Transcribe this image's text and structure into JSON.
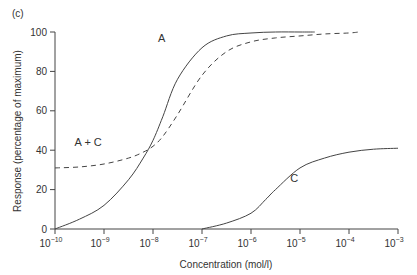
{
  "panel_label": "(c)",
  "chart_data": {
    "type": "line",
    "title": "",
    "xlabel": "Concentration (mol/l)",
    "ylabel": "Response (percentage of maximum)",
    "xscale": "log",
    "xlim": [
      1e-10,
      0.001
    ],
    "ylim": [
      0,
      100
    ],
    "grid": false,
    "legend": "inline curve labels",
    "x_ticks": [
      "10-10",
      "10-9",
      "10-8",
      "10-7",
      "10-6",
      "10-5",
      "10-4",
      "10-3"
    ],
    "y_ticks": [
      "0",
      "20",
      "40",
      "60",
      "80",
      "100"
    ],
    "series": [
      {
        "name": "A",
        "style": "solid",
        "log10_x": [
          -10,
          -9.5,
          -9,
          -8.5,
          -8.2,
          -8,
          -7.8,
          -7.5,
          -7,
          -6.5,
          -6,
          -5.5,
          -5,
          -4.7
        ],
        "y": [
          0,
          5,
          12,
          25,
          36,
          45,
          57,
          76,
          92,
          98,
          99.5,
          100,
          100,
          100
        ]
      },
      {
        "name": "A + C",
        "style": "dashed",
        "log10_x": [
          -10,
          -9.5,
          -9,
          -8.5,
          -8.2,
          -8,
          -7.8,
          -7.5,
          -7,
          -6.5,
          -6,
          -5.5,
          -5,
          -4.5,
          -4,
          -3.8
        ],
        "y": [
          31,
          31.5,
          33,
          36,
          39,
          42,
          47,
          58,
          78,
          90,
          95,
          97,
          98,
          99,
          99.5,
          100
        ]
      },
      {
        "name": "C",
        "style": "solid",
        "log10_x": [
          -7,
          -6.5,
          -6,
          -5.7,
          -5.5,
          -5,
          -4.5,
          -4,
          -3.5,
          -3
        ],
        "y": [
          0,
          3,
          8,
          15,
          20,
          31,
          36,
          39,
          40.5,
          41
        ]
      }
    ],
    "annotations": [
      {
        "text": "A",
        "log10_x": -7.9,
        "y": 95
      },
      {
        "text": "A + C",
        "log10_x": -9.6,
        "y": 42
      },
      {
        "text": "C",
        "log10_x": -5.2,
        "y": 24
      }
    ]
  }
}
